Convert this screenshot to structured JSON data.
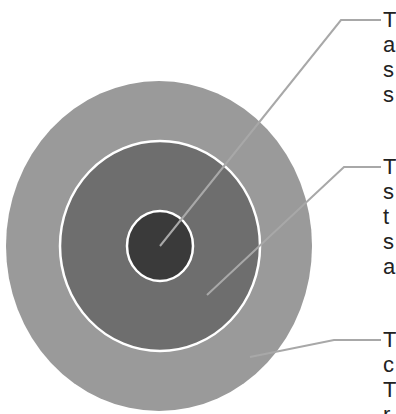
{
  "diagram": {
    "type": "concentric-circles",
    "colors": {
      "background": "#ffffff",
      "outer_ring": "#9a9a9a",
      "middle_ring": "#6e6e6e",
      "inner_circle": "#3a3a3a",
      "ring_border": "#ffffff",
      "leader_line": "#a8a8a8",
      "text": "#222222"
    },
    "layers": [
      {
        "name": "inner",
        "cx": 160,
        "cy": 246,
        "rx": 33,
        "ry": 35
      },
      {
        "name": "middle",
        "cx": 160,
        "cy": 246,
        "rx": 100,
        "ry": 105
      },
      {
        "name": "outer",
        "cx": 159,
        "cy": 246,
        "rx": 153,
        "ry": 165
      }
    ],
    "labels": [
      {
        "id": "label-inner",
        "lines": [
          "T",
          "a",
          "s",
          "s"
        ]
      },
      {
        "id": "label-middle",
        "lines": [
          "T",
          "s",
          "t",
          "s",
          "a"
        ]
      },
      {
        "id": "label-outer",
        "lines": [
          "T",
          "c",
          "T",
          "r"
        ]
      }
    ]
  }
}
